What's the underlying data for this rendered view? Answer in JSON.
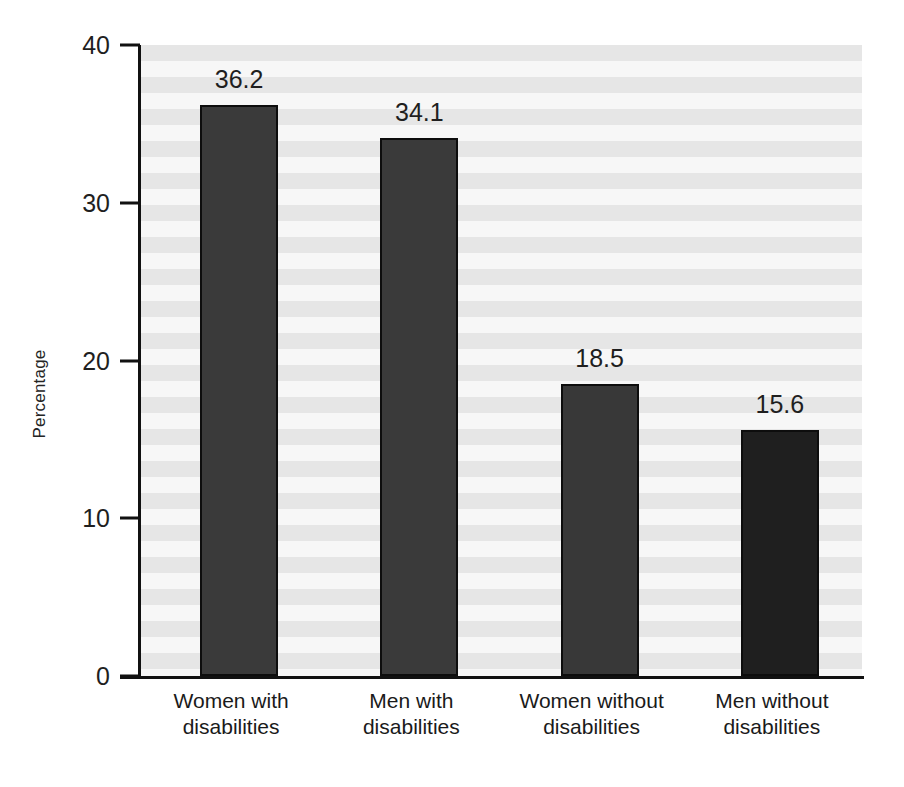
{
  "chart_data": {
    "type": "bar",
    "title": "",
    "subtitle": "",
    "xlabel": "",
    "ylabel": "Percentage",
    "ylim": [
      0,
      40
    ],
    "yticks": [
      0,
      10,
      20,
      30,
      40
    ],
    "ytick_labels": [
      "0",
      "10",
      "20",
      "30",
      "40"
    ],
    "grid": false,
    "legend": false,
    "legend_position": "none",
    "background": "horizontal-striped-gray",
    "categories": [
      "Women with disabilities",
      "Men with disabilities",
      "Women without disabilities",
      "Men without disabilities"
    ],
    "category_lines": [
      [
        "Women with",
        "disabilities"
      ],
      [
        "Men with",
        "disabilities"
      ],
      [
        "Women without",
        "disabilities"
      ],
      [
        "Men without",
        "disabilities"
      ]
    ],
    "values": [
      36.2,
      34.1,
      18.5,
      15.6
    ],
    "value_labels": [
      "36.2",
      "34.1",
      "18.5",
      "15.6"
    ],
    "bar_colors": [
      "#3a3a3a",
      "#3a3a3a",
      "#383838",
      "#1f1f1f"
    ],
    "bar_edge_color": "#0d0d0d",
    "axis_color": "#111111",
    "text_color": "#1f1f1f",
    "plot_band_light": "#f7f7f7",
    "plot_band_dark": "#e6e6e6"
  },
  "axis": {
    "y_title": "Percentage"
  }
}
